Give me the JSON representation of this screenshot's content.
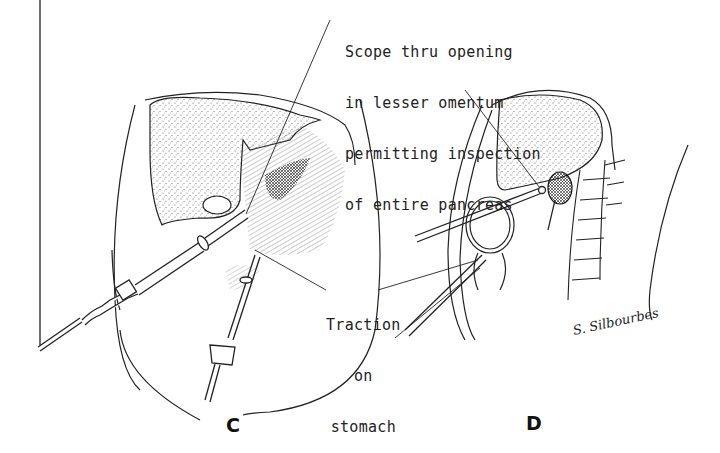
{
  "figure": {
    "panels": [
      {
        "id": "C",
        "label": "C"
      },
      {
        "id": "D",
        "label": "D"
      }
    ],
    "annotations": {
      "scope": {
        "lines": [
          "Scope thru opening",
          "in lesser omentum",
          "permitting inspection",
          "of entire pancreas"
        ]
      },
      "traction": {
        "lines": [
          "Traction",
          "on",
          "stomach"
        ]
      }
    },
    "signature": "S. Silbourbes",
    "colors": {
      "ink": "#222222",
      "background": "#ffffff",
      "stipple": "#555555"
    }
  }
}
